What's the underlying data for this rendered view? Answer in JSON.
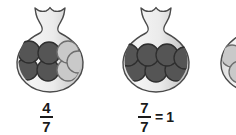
{
  "illustration": {
    "title": "Fractions of marbles in vases",
    "background_color": "#ffffff"
  },
  "palette": {
    "dark_marble": "#555555",
    "dark_marble_edge": "#2e2e2e",
    "light_marble": "#c9c9c9",
    "light_marble_edge": "#6e6e6e",
    "vase_fill_light": "#f2f2f2",
    "vase_fill_mid": "#e2e2e2",
    "vase_fill_shadow": "#c4c4c4",
    "vase_outline": "#4a4a4a",
    "text": "#1a1a1a"
  },
  "vases": [
    {
      "id": "vase-1",
      "label_numerator": "4",
      "label_denominator": "7",
      "label_equals": "",
      "label_whole": "",
      "total_marbles": 7,
      "dark_marbles": 4,
      "light_marbles": 3,
      "marbles": [
        {
          "row": "top",
          "shade": "dark"
        },
        {
          "row": "top",
          "shade": "dark"
        },
        {
          "row": "top",
          "shade": "light"
        },
        {
          "row": "top",
          "shade": "light"
        },
        {
          "row": "bottom",
          "shade": "dark"
        },
        {
          "row": "bottom",
          "shade": "dark"
        },
        {
          "row": "bottom",
          "shade": "light"
        }
      ],
      "clipped": false
    },
    {
      "id": "vase-2",
      "label_numerator": "7",
      "label_denominator": "7",
      "label_equals": "=",
      "label_whole": "1",
      "total_marbles": 7,
      "dark_marbles": 7,
      "light_marbles": 0,
      "marbles": [
        {
          "row": "top",
          "shade": "dark"
        },
        {
          "row": "top",
          "shade": "dark"
        },
        {
          "row": "top",
          "shade": "dark"
        },
        {
          "row": "top",
          "shade": "dark"
        },
        {
          "row": "bottom",
          "shade": "dark"
        },
        {
          "row": "bottom",
          "shade": "dark"
        },
        {
          "row": "bottom",
          "shade": "dark"
        }
      ],
      "clipped": false
    },
    {
      "id": "vase-3",
      "label_numerator": "",
      "label_denominator": "",
      "label_equals": "",
      "label_whole": "",
      "total_marbles": 3,
      "dark_marbles": 0,
      "light_marbles": 3,
      "marbles": [
        {
          "row": "top",
          "shade": "light"
        },
        {
          "row": "top",
          "shade": "light"
        },
        {
          "row": "bottom",
          "shade": "light"
        }
      ],
      "clipped": true
    }
  ]
}
